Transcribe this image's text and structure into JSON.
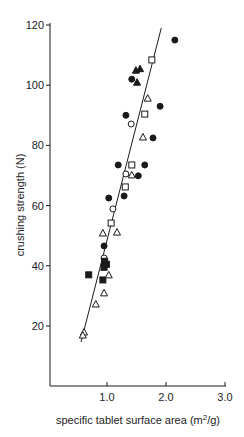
{
  "chart_data": {
    "type": "scatter",
    "title": "",
    "xlabel": "specific tablet surface area (m2/g)",
    "xlabel_parts": {
      "main": "specific tablet surface area (m",
      "sup": "2",
      "tail": "/g)"
    },
    "ylabel": "crushing strength (N)",
    "xlim": [
      0,
      3.0
    ],
    "ylim": [
      0,
      120
    ],
    "x_ticks": [
      {
        "value": 1.0,
        "label": "1.0"
      },
      {
        "value": 2.0,
        "label": "2.0"
      },
      {
        "value": 3.0,
        "label": "3.0"
      }
    ],
    "y_ticks": [
      {
        "value": 20,
        "label": "20"
      },
      {
        "value": 40,
        "label": "40"
      },
      {
        "value": 60,
        "label": "60"
      },
      {
        "value": 80,
        "label": "80"
      },
      {
        "value": 100,
        "label": "100"
      },
      {
        "value": 120,
        "label": "120"
      }
    ],
    "grid": false,
    "legend": null,
    "series": [
      {
        "name": "filled circle",
        "marker": "circle",
        "filled": true,
        "points": [
          [
            2.15,
            115
          ],
          [
            1.42,
            102
          ],
          [
            1.9,
            93
          ],
          [
            1.32,
            90
          ],
          [
            1.78,
            82.5
          ],
          [
            1.19,
            73.5
          ],
          [
            1.64,
            73.5
          ],
          [
            1.53,
            69.9
          ],
          [
            1.29,
            63.2
          ],
          [
            1.03,
            62.5
          ],
          [
            0.95,
            46.6
          ]
        ]
      },
      {
        "name": "open circle",
        "marker": "circle",
        "filled": false,
        "points": [
          [
            1.41,
            87.1
          ],
          [
            1.32,
            70.5
          ],
          [
            1.1,
            58.9
          ],
          [
            0.95,
            42.6
          ]
        ]
      },
      {
        "name": "open square",
        "marker": "square",
        "filled": false,
        "points": [
          [
            1.76,
            108.4
          ],
          [
            1.64,
            90.4
          ],
          [
            1.42,
            73.5
          ],
          [
            1.31,
            66.2
          ],
          [
            1.07,
            54.2
          ]
        ]
      },
      {
        "name": "filled square",
        "marker": "square",
        "filled": true,
        "points": [
          [
            0.96,
            41.5
          ],
          [
            0.99,
            40.5
          ],
          [
            0.95,
            39.5
          ],
          [
            0.69,
            37.0
          ],
          [
            0.93,
            35.3
          ]
        ]
      },
      {
        "name": "open triangle",
        "marker": "triangle",
        "filled": false,
        "points": [
          [
            1.69,
            95.7
          ],
          [
            1.61,
            82.8
          ],
          [
            1.42,
            70.2
          ],
          [
            0.93,
            50.9
          ],
          [
            1.17,
            51.2
          ],
          [
            1.03,
            37.0
          ],
          [
            0.95,
            31.0
          ],
          [
            0.81,
            27.3
          ],
          [
            0.61,
            18.0
          ],
          [
            0.59,
            17.0
          ]
        ]
      },
      {
        "name": "filled triangle",
        "marker": "triangle",
        "filled": true,
        "points": [
          [
            1.49,
            105
          ],
          [
            1.56,
            105.5
          ],
          [
            1.51,
            101
          ]
        ]
      }
    ],
    "regression_line": {
      "x": [
        0.56,
        1.92
      ],
      "y": [
        14.7,
        119.0
      ]
    }
  },
  "style": {
    "ink": "#1a1a1a",
    "background": "#ffffff"
  }
}
